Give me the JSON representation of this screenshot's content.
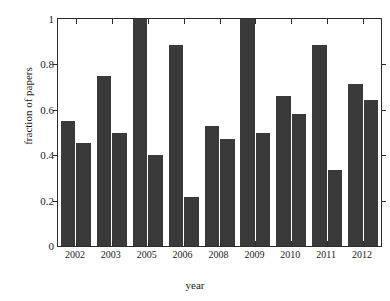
{
  "chart_data": {
    "type": "bar",
    "title": "",
    "xlabel": "year",
    "ylabel": "fraction of papers",
    "categories": [
      "2002",
      "2003",
      "2005",
      "2006",
      "2008",
      "2009",
      "2010",
      "2011",
      "2012"
    ],
    "series": [
      {
        "name": "bar-a",
        "values": [
          0.55,
          0.75,
          1.0,
          0.885,
          0.53,
          1.0,
          0.66,
          0.885,
          0.715
        ]
      },
      {
        "name": "bar-b",
        "values": [
          0.455,
          0.5,
          0.4,
          0.215,
          0.47,
          0.5,
          0.58,
          0.335,
          0.645
        ]
      }
    ],
    "ylim": [
      0,
      1
    ],
    "yticks": [
      0,
      0.2,
      0.4,
      0.6,
      0.8,
      1
    ],
    "ytick_labels": [
      "0",
      "0.2",
      "0.4",
      "0.6",
      "0.8",
      "1"
    ],
    "grid": false,
    "legend": "none",
    "bar_color": "#3a3a3a",
    "axis_color": "#2b2b2b"
  }
}
